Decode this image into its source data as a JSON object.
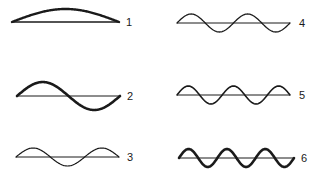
{
  "diagram": {
    "title": "",
    "colors": {
      "stroke": "#1a1a1a",
      "background": "#ffffff"
    },
    "panels": [
      {
        "label": "1",
        "half_loops": 1,
        "x0": 12,
        "x1": 119,
        "y": 22,
        "amp": 13,
        "stroke_width": 2.4,
        "upper_only": true,
        "label_x": 126,
        "label_y": 26
      },
      {
        "label": "2",
        "half_loops": 2,
        "x0": 17,
        "x1": 120,
        "y": 96,
        "amp": 14,
        "stroke_width": 2.6,
        "upper_only": false,
        "label_x": 127,
        "label_y": 100
      },
      {
        "label": "3",
        "half_loops": 3,
        "x0": 16,
        "x1": 119,
        "y": 157,
        "amp": 9,
        "stroke_width": 1.2,
        "upper_only": false,
        "label_x": 127,
        "label_y": 161
      },
      {
        "label": "4",
        "half_loops": 4,
        "x0": 177,
        "x1": 290,
        "y": 23,
        "amp": 9,
        "stroke_width": 1.3,
        "upper_only": false,
        "label_x": 299,
        "label_y": 27
      },
      {
        "label": "5",
        "half_loops": 5,
        "x0": 177,
        "x1": 290,
        "y": 95,
        "amp": 9,
        "stroke_width": 1.6,
        "upper_only": false,
        "label_x": 299,
        "label_y": 99
      },
      {
        "label": "6",
        "half_loops": 6,
        "x0": 179,
        "x1": 294,
        "y": 158,
        "amp": 9,
        "stroke_width": 2.6,
        "upper_only": false,
        "label_x": 301,
        "label_y": 162
      }
    ]
  }
}
